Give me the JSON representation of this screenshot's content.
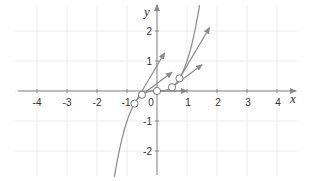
{
  "chart_data": {
    "type": "line",
    "title": "",
    "function": "y = x^3",
    "xlabel": "x",
    "ylabel": "y",
    "xlim": [
      -4.6,
      4.6
    ],
    "ylim": [
      -2.8,
      2.85
    ],
    "grid": true,
    "legend": null,
    "x_ticks": [
      -4,
      -3,
      -2,
      -1,
      0,
      1,
      2,
      3,
      4
    ],
    "x_tick_labels": [
      "-4",
      "-3",
      "-2",
      "-1",
      "0",
      "1",
      "2",
      "3",
      "4"
    ],
    "y_ticks": [
      -2,
      -1,
      1,
      2
    ],
    "y_tick_labels": [
      "-2",
      "-1",
      "1",
      "2"
    ],
    "curve": {
      "name": "y = x^3",
      "x_range": [
        -1.42,
        1.42
      ],
      "color": "#888888"
    },
    "points": [
      {
        "x": -0.75,
        "y": -0.421875
      },
      {
        "x": -0.5,
        "y": -0.125
      },
      {
        "x": 0,
        "y": 0
      },
      {
        "x": 0.5,
        "y": 0.125
      },
      {
        "x": 0.75,
        "y": 0.421875
      }
    ],
    "tangent_vectors": [
      {
        "from": [
          -0.75,
          -0.421875
        ],
        "to": [
          0.25,
          1.265625
        ],
        "slope": 1.6875
      },
      {
        "from": [
          -0.5,
          -0.125
        ],
        "to": [
          0.5,
          0.625
        ],
        "slope": 0.75
      },
      {
        "from": [
          0,
          0
        ],
        "to": [
          1,
          0
        ],
        "slope": 0
      },
      {
        "from": [
          0.5,
          0.125
        ],
        "to": [
          1.5,
          0.875
        ],
        "slope": 0.75
      },
      {
        "from": [
          0.75,
          0.421875
        ],
        "to": [
          1.75,
          2.109375
        ],
        "slope": 1.6875
      }
    ],
    "colors": {
      "grid": "#ececec",
      "axis": "#888888",
      "curve": "#8a8a8a",
      "arrow": "#8a8a8a",
      "point_fill": "#ffffff",
      "point_stroke": "#777777"
    }
  },
  "labels": {
    "x_axis": "x",
    "y_axis": "y",
    "x_ticks": [
      "-4",
      "-3",
      "-2",
      "-1",
      "0",
      "1",
      "2",
      "3",
      "4"
    ],
    "y_ticks": [
      "2",
      "1",
      "-1",
      "-2"
    ]
  }
}
